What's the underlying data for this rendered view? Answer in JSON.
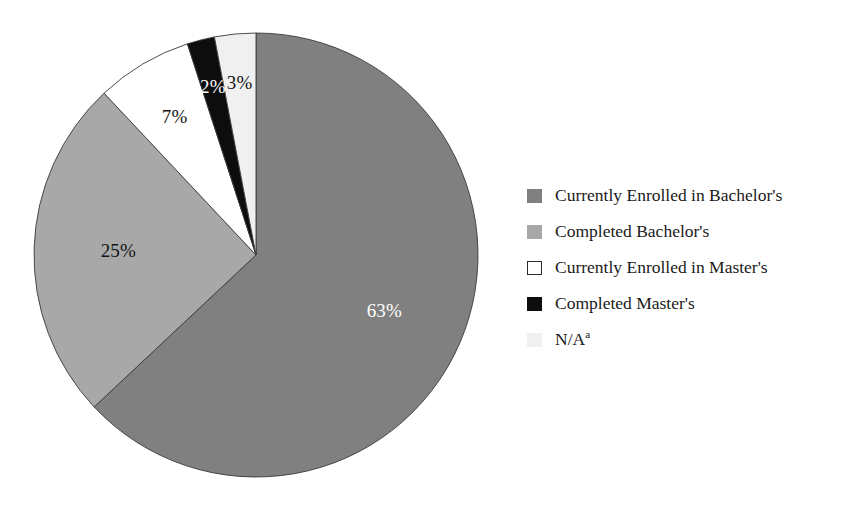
{
  "chart_data": {
    "type": "pie",
    "title": "",
    "subtitle": "",
    "xlabel": "",
    "ylabel": "",
    "legend_position": "right",
    "grid": false,
    "categories": [
      "Currently Enrolled in Bachelor's",
      "Completed Bachelor's",
      "Currently Enrolled in Master's",
      "Completed Master's",
      "N/A"
    ],
    "values": [
      63,
      25,
      7,
      2,
      3
    ],
    "value_labels": [
      "63%",
      "25%",
      "7%",
      "2%",
      "3%"
    ],
    "colors": [
      "#808080",
      "#a8a8a8",
      "#ffffff",
      "#0d0d0d",
      "#f0f0f0"
    ],
    "label_text_colors": [
      "#ffffff",
      "#141414",
      "#141414",
      "#ffffff",
      "#141414"
    ],
    "slices": [
      {
        "name": "Currently Enrolled in Bachelor's",
        "value": 63,
        "label": "63%",
        "color": "#808080",
        "label_color": "#ffffff"
      },
      {
        "name": "Completed Bachelor's",
        "value": 25,
        "label": "25%",
        "color": "#a8a8a8",
        "label_color": "#141414"
      },
      {
        "name": "Currently Enrolled in Master's",
        "value": 7,
        "label": "7%",
        "color": "#ffffff",
        "label_color": "#141414"
      },
      {
        "name": "Completed Master's",
        "value": 2,
        "label": "2%",
        "color": "#0d0d0d",
        "label_color": "#ffffff"
      },
      {
        "name": "N/A",
        "value": 3,
        "label": "3%",
        "color": "#f0f0f0",
        "label_color": "#141414"
      }
    ]
  },
  "pie": {
    "label_63": "63%",
    "label_25": "25%",
    "label_7": "7%",
    "label_2": "2%",
    "label_3": "3%"
  },
  "legend": {
    "items": [
      {
        "label": "Currently Enrolled in Bachelor's",
        "swatch": "#808080",
        "footnote": ""
      },
      {
        "label": "Completed Bachelor's",
        "swatch": "#a8a8a8",
        "footnote": ""
      },
      {
        "label": "Currently Enrolled in Master's",
        "swatch": "#ffffff",
        "footnote": ""
      },
      {
        "label": "Completed Master's",
        "swatch": "#0d0d0d",
        "footnote": ""
      },
      {
        "label": "N/A",
        "swatch": "#f0f0f0",
        "footnote": "a"
      }
    ]
  }
}
